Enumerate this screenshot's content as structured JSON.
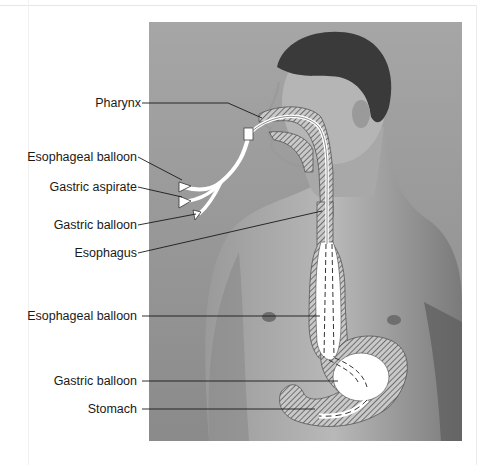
{
  "figure": {
    "labels": [
      {
        "id": "pharynx",
        "text": "Pharynx"
      },
      {
        "id": "esophageal-balloon-port",
        "text": "Esophageal balloon"
      },
      {
        "id": "gastric-aspirate-port",
        "text": "Gastric aspirate"
      },
      {
        "id": "gastric-balloon-port",
        "text": "Gastric balloon"
      },
      {
        "id": "esophagus",
        "text": "Esophagus"
      },
      {
        "id": "esophageal-balloon",
        "text": "Esophageal balloon"
      },
      {
        "id": "gastric-balloon",
        "text": "Gastric balloon"
      },
      {
        "id": "stomach",
        "text": "Stomach"
      }
    ]
  },
  "colors": {
    "background_photo": "#8f8f8f",
    "tube": "#ffffff",
    "hatch": "#5a5a5a",
    "leader_line": "#1a1a1a",
    "label_text": "#1a1a1a"
  }
}
